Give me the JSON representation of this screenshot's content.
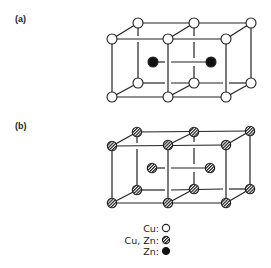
{
  "panels": [
    {
      "label": "(a)",
      "description": "Body-centered cubic arrangement, two unit cells, Cu at corners, Zn at body centers (ordered)",
      "corner_atom": "Cu",
      "center_atom": "Zn"
    },
    {
      "label": "(b)",
      "description": "Disordered arrangement, two unit cells, Cu/Zn mixed at all sites",
      "corner_atom": "Cu, Zn",
      "center_atom": "Cu, Zn"
    }
  ],
  "legend": {
    "items": [
      {
        "label": "Cu:",
        "symbol": "open-circle"
      },
      {
        "label": "Cu, Zn:",
        "symbol": "hatched-circle"
      },
      {
        "label": "Zn:",
        "symbol": "filled-circle"
      }
    ]
  },
  "colors": {
    "line": "#222222",
    "background": "#ffffff",
    "filled_atom": "#111111",
    "open_atom": "#ffffff"
  }
}
